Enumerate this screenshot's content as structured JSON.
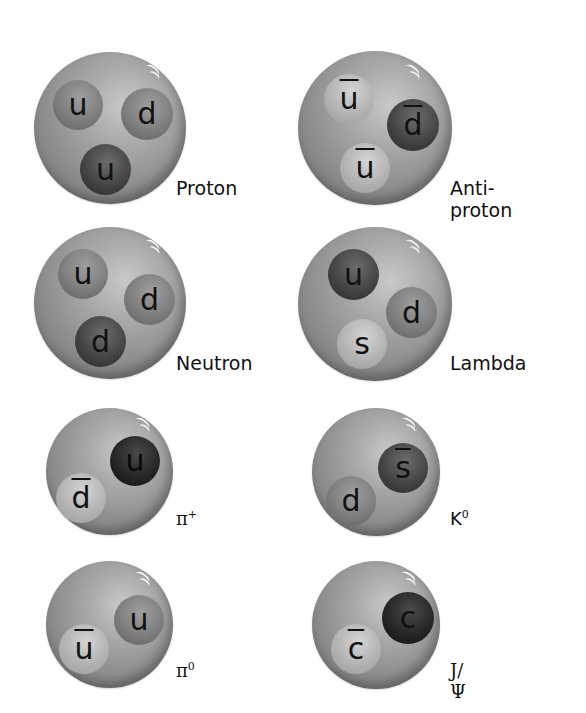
{
  "particles": [
    {
      "name": "Proton",
      "quarks": [
        "u",
        "d",
        "u"
      ],
      "antiquarks": []
    },
    {
      "name": "Anti-proton",
      "quarks": [],
      "antiquarks": [
        "u",
        "d",
        "u"
      ]
    },
    {
      "name": "Neutron",
      "quarks": [
        "u",
        "d",
        "d"
      ],
      "antiquarks": []
    },
    {
      "name": "Lambda",
      "quarks": [
        "u",
        "d",
        "s"
      ],
      "antiquarks": []
    },
    {
      "name": "π+",
      "base": "π",
      "sup": "+",
      "quarks": [
        "u"
      ],
      "antiquarks": [
        "d"
      ]
    },
    {
      "name": "K0",
      "base": "K",
      "sup": "0",
      "quarks": [
        "d"
      ],
      "antiquarks": [
        "s"
      ]
    },
    {
      "name": "π0",
      "base": "π",
      "sup": "0",
      "quarks": [
        "u"
      ],
      "antiquarks": [
        "u"
      ]
    },
    {
      "name": "J/Ψ",
      "quarks": [
        "c"
      ],
      "antiquarks": [
        "c"
      ]
    }
  ],
  "labels": {
    "proton": "Proton",
    "antiproton": "Anti-proton",
    "neutron": "Neutron",
    "lambda": "Lambda",
    "pi_plus_base": "π",
    "pi_plus_sup": "+",
    "k0_base": "K",
    "k0_sup": "0",
    "pi0_base": "π",
    "pi0_sup": "0",
    "jpsi": "J/Ψ"
  },
  "quark_symbols": {
    "proton": [
      "u",
      "d",
      "u"
    ],
    "antiproton": [
      "u",
      "d",
      "u"
    ],
    "neutron": [
      "u",
      "d",
      "d"
    ],
    "lambda": [
      "u",
      "d",
      "s"
    ],
    "pi_plus": [
      "u",
      "d"
    ],
    "k0": [
      "s",
      "d"
    ],
    "pi0": [
      "u",
      "u"
    ],
    "jpsi": [
      "c",
      "c"
    ]
  }
}
